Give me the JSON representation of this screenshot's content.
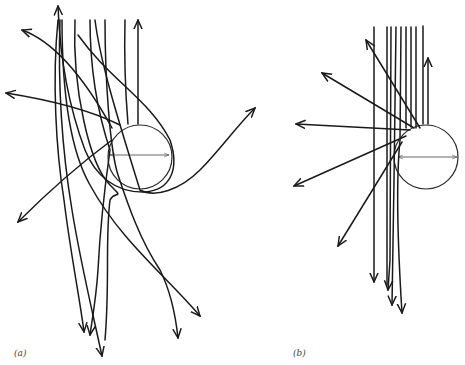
{
  "figure": {
    "type": "ray-trajectory diagram",
    "panels": [
      {
        "id": "a",
        "label": "(a)",
        "sphere": {
          "cx": 140,
          "cy": 157,
          "r": 32
        },
        "description": "Incoming vertical parallel rays deflected strongly by sphere; some loop around and are scattered to wide angles"
      },
      {
        "id": "b",
        "label": "(b)",
        "sphere": {
          "cx": 426,
          "cy": 157,
          "r": 32
        },
        "description": "Incoming vertical parallel rays grazing sphere edge, scattered in a narrow fan"
      }
    ],
    "colors": {
      "line": "#1a1a1a",
      "background": "#ffffff"
    }
  }
}
